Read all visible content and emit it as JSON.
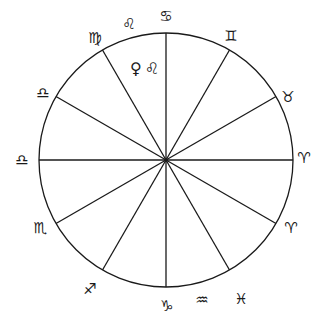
{
  "diagram": {
    "type": "astrological-house-wheel",
    "center": [
      166,
      160
    ],
    "radius": 127,
    "spoke_angles_deg": [
      0,
      30,
      60,
      90,
      120,
      150
    ],
    "line_color": "#1a1a1a",
    "signs": [
      {
        "name": "cancer",
        "glyph": "♋",
        "x": 166,
        "y": 16
      },
      {
        "name": "leo",
        "glyph": "♌",
        "x": 129,
        "y": 24
      },
      {
        "name": "virgo",
        "glyph": "♍",
        "x": 95,
        "y": 38
      },
      {
        "name": "gemini",
        "glyph": "♊",
        "x": 231,
        "y": 36
      },
      {
        "name": "taurus",
        "glyph": "♉",
        "x": 288,
        "y": 97
      },
      {
        "name": "libra-upper",
        "glyph": "♎",
        "x": 43,
        "y": 93
      },
      {
        "name": "libra-left",
        "glyph": "♎",
        "x": 22,
        "y": 160
      },
      {
        "name": "aries-right",
        "glyph": "♈",
        "x": 304,
        "y": 158
      },
      {
        "name": "scorpio",
        "glyph": "♏",
        "x": 40,
        "y": 228
      },
      {
        "name": "aries-lower",
        "glyph": "♈",
        "x": 291,
        "y": 228
      },
      {
        "name": "sagittarius",
        "glyph": "♐",
        "x": 90,
        "y": 289
      },
      {
        "name": "capricorn",
        "glyph": "♑",
        "x": 167,
        "y": 306
      },
      {
        "name": "aquarius",
        "glyph": "♒",
        "x": 202,
        "y": 300
      },
      {
        "name": "pisces",
        "glyph": "♓",
        "x": 241,
        "y": 299
      }
    ],
    "inner_label": {
      "text": "♀♌",
      "meaning": "Venus in Leo",
      "x": 146,
      "y": 69
    }
  }
}
